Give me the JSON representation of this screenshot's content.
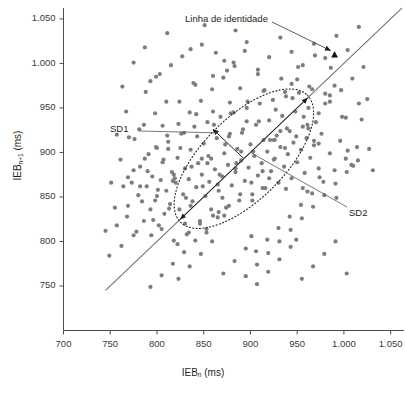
{
  "chart_data": {
    "type": "scatter",
    "title": "",
    "xlabel": "IEB_n (ms)",
    "ylabel": "IEB_n+1 (ms)",
    "xlabel_base": "IEB",
    "xlabel_sub": "n",
    "xlabel_unit": "(ms)",
    "ylabel_base": "IEB",
    "ylabel_sub": "n+1",
    "ylabel_unit": "(ms)",
    "xlim": [
      700,
      1060
    ],
    "ylim": [
      700,
      1060
    ],
    "xticks": [
      700,
      750,
      800,
      850,
      900,
      950,
      1000,
      1050
    ],
    "yticks": [
      750,
      800,
      850,
      900,
      950,
      1000,
      1050
    ],
    "xticklabels": [
      "700",
      "750",
      "800",
      "850",
      "900",
      "950",
      "1.000",
      "1.050"
    ],
    "yticklabels": [
      "750",
      "800",
      "850",
      "900",
      "950",
      "1.000",
      "1.050"
    ],
    "grid": false,
    "legend": "none",
    "point_color": "#7d7d7d",
    "point_radius": 2.1,
    "n_points": 300,
    "annotations": [
      {
        "name": "identity-line-label",
        "text": "Linha de identidade",
        "x": 990,
        "y": 1012
      },
      {
        "name": "sd1-label",
        "text": "SD1",
        "x": 845,
        "y": 917
      },
      {
        "name": "sd2-label",
        "text": "SD2",
        "x": 1010,
        "y": 855
      }
    ],
    "identity_line": {
      "x0": 745,
      "y0": 745,
      "x1": 1062,
      "y1": 1062,
      "color": "#6e6e6e"
    },
    "ellipse": {
      "cx": 893,
      "cy": 893,
      "sd2_semi": 96,
      "sd1_semi": 46,
      "angle_deg": 45,
      "style": "dotted",
      "color": "#1a1a1a"
    },
    "sd1_arrow": {
      "x0": 893,
      "y0": 893,
      "x1": 860,
      "y1": 926,
      "label": "SD1"
    },
    "sd2_arrows": [
      {
        "x0": 893,
        "y0": 893,
        "x1": 961,
        "y1": 961
      },
      {
        "x0": 893,
        "y0": 893,
        "x1": 825,
        "y1": 825
      }
    ],
    "identity_marker": {
      "x": 990,
      "y": 1010,
      "shape": "triangle",
      "color": "#111111"
    },
    "points": [
      [
        769,
        840
      ],
      [
        775,
        807
      ],
      [
        780,
        852
      ],
      [
        782,
        884
      ],
      [
        786,
        823
      ],
      [
        789,
        862
      ],
      [
        791,
        898
      ],
      [
        793,
        836
      ],
      [
        795,
        873
      ],
      [
        798,
        846
      ],
      [
        800,
        905
      ],
      [
        802,
        818
      ],
      [
        804,
        869
      ],
      [
        806,
        889
      ],
      [
        808,
        831
      ],
      [
        810,
        857
      ],
      [
        812,
        912
      ],
      [
        814,
        842
      ],
      [
        816,
        878
      ],
      [
        818,
        801
      ],
      [
        820,
        866
      ],
      [
        822,
        894
      ],
      [
        824,
        836
      ],
      [
        826,
        921
      ],
      [
        828,
        853
      ],
      [
        830,
        882
      ],
      [
        832,
        808
      ],
      [
        834,
        870
      ],
      [
        836,
        903
      ],
      [
        838,
        845
      ],
      [
        840,
        929
      ],
      [
        842,
        861
      ],
      [
        844,
        888
      ],
      [
        846,
        820
      ],
      [
        848,
        875
      ],
      [
        850,
        910
      ],
      [
        852,
        851
      ],
      [
        854,
        934
      ],
      [
        856,
        867
      ],
      [
        858,
        893
      ],
      [
        860,
        829
      ],
      [
        862,
        881
      ],
      [
        864,
        916
      ],
      [
        866,
        857
      ],
      [
        868,
        940
      ],
      [
        870,
        873
      ],
      [
        872,
        899
      ],
      [
        874,
        838
      ],
      [
        876,
        886
      ],
      [
        878,
        921
      ],
      [
        880,
        863
      ],
      [
        882,
        945
      ],
      [
        884,
        878
      ],
      [
        886,
        904
      ],
      [
        888,
        846
      ],
      [
        890,
        891
      ],
      [
        892,
        926
      ],
      [
        894,
        868
      ],
      [
        896,
        950
      ],
      [
        898,
        883
      ],
      [
        900,
        909
      ],
      [
        902,
        853
      ],
      [
        904,
        896
      ],
      [
        906,
        931
      ],
      [
        908,
        874
      ],
      [
        910,
        955
      ],
      [
        912,
        888
      ],
      [
        914,
        914
      ],
      [
        916,
        860
      ],
      [
        918,
        901
      ],
      [
        920,
        936
      ],
      [
        922,
        879
      ],
      [
        924,
        959
      ],
      [
        926,
        893
      ],
      [
        928,
        919
      ],
      [
        930,
        866
      ],
      [
        932,
        906
      ],
      [
        934,
        941
      ],
      [
        936,
        884
      ],
      [
        938,
        963
      ],
      [
        940,
        898
      ],
      [
        942,
        924
      ],
      [
        944,
        871
      ],
      [
        946,
        911
      ],
      [
        948,
        946
      ],
      [
        950,
        889
      ],
      [
        952,
        967
      ],
      [
        954,
        903
      ],
      [
        956,
        929
      ],
      [
        958,
        877
      ],
      [
        960,
        916
      ],
      [
        962,
        950
      ],
      [
        964,
        894
      ],
      [
        966,
        971
      ],
      [
        968,
        908
      ],
      [
        970,
        934
      ],
      [
        973,
        882
      ],
      [
        976,
        921
      ],
      [
        980,
        955
      ],
      [
        985,
        899
      ],
      [
        990,
        975
      ],
      [
        996,
        913
      ],
      [
        1002,
        939
      ],
      [
        1008,
        886
      ],
      [
        762,
        795
      ],
      [
        768,
        828
      ],
      [
        773,
        866
      ],
      [
        778,
        811
      ],
      [
        784,
        845
      ],
      [
        790,
        879
      ],
      [
        796,
        824
      ],
      [
        801,
        858
      ],
      [
        807,
        892
      ],
      [
        813,
        837
      ],
      [
        819,
        871
      ],
      [
        825,
        905
      ],
      [
        831,
        849
      ],
      [
        837,
        884
      ],
      [
        843,
        918
      ],
      [
        849,
        862
      ],
      [
        855,
        896
      ],
      [
        861,
        931
      ],
      [
        867,
        875
      ],
      [
        873,
        909
      ],
      [
        879,
        944
      ],
      [
        885,
        888
      ],
      [
        891,
        922
      ],
      [
        897,
        957
      ],
      [
        903,
        901
      ],
      [
        909,
        935
      ],
      [
        915,
        970
      ],
      [
        921,
        914
      ],
      [
        927,
        948
      ],
      [
        933,
        983
      ],
      [
        939,
        927
      ],
      [
        945,
        961
      ],
      [
        951,
        996
      ],
      [
        957,
        940
      ],
      [
        963,
        974
      ],
      [
        969,
        1009
      ],
      [
        786,
        931
      ],
      [
        798,
        944
      ],
      [
        810,
        957
      ],
      [
        822,
        797
      ],
      [
        834,
        810
      ],
      [
        846,
        823
      ],
      [
        858,
        836
      ],
      [
        870,
        849
      ],
      [
        882,
        1001
      ],
      [
        894,
        1014
      ],
      [
        906,
        789
      ],
      [
        918,
        802
      ],
      [
        930,
        815
      ],
      [
        942,
        828
      ],
      [
        954,
        841
      ],
      [
        966,
        854
      ],
      [
        978,
        867
      ],
      [
        990,
        880
      ],
      [
        1002,
        893
      ],
      [
        1014,
        906
      ],
      [
        775,
        880
      ],
      [
        787,
        893
      ],
      [
        799,
        906
      ],
      [
        811,
        919
      ],
      [
        823,
        932
      ],
      [
        835,
        945
      ],
      [
        847,
        958
      ],
      [
        859,
        971
      ],
      [
        871,
        984
      ],
      [
        883,
        997
      ],
      [
        895,
        761
      ],
      [
        907,
        774
      ],
      [
        919,
        787
      ],
      [
        931,
        800
      ],
      [
        943,
        813
      ],
      [
        955,
        826
      ],
      [
        967,
        839
      ],
      [
        979,
        852
      ],
      [
        991,
        865
      ],
      [
        1003,
        878
      ],
      [
        1015,
        891
      ],
      [
        1027,
        904
      ],
      [
        793,
        749
      ],
      [
        805,
        762
      ],
      [
        817,
        775
      ],
      [
        829,
        788
      ],
      [
        841,
        801
      ],
      [
        853,
        814
      ],
      [
        865,
        827
      ],
      [
        877,
        840
      ],
      [
        889,
        853
      ],
      [
        901,
        866
      ],
      [
        913,
        879
      ],
      [
        925,
        892
      ],
      [
        937,
        905
      ],
      [
        949,
        918
      ],
      [
        961,
        931
      ],
      [
        973,
        944
      ],
      [
        985,
        957
      ],
      [
        997,
        970
      ],
      [
        1009,
        983
      ],
      [
        1021,
        996
      ],
      [
        764,
        862
      ],
      [
        776,
        915
      ],
      [
        788,
        968
      ],
      [
        800,
        851
      ],
      [
        812,
        904
      ],
      [
        824,
        957
      ],
      [
        836,
        840
      ],
      [
        848,
        893
      ],
      [
        860,
        946
      ],
      [
        872,
        829
      ],
      [
        884,
        882
      ],
      [
        896,
        935
      ],
      [
        908,
        988
      ],
      [
        920,
        871
      ],
      [
        932,
        924
      ],
      [
        944,
        977
      ],
      [
        956,
        860
      ],
      [
        968,
        913
      ],
      [
        980,
        966
      ],
      [
        992,
        849
      ],
      [
        1004,
        902
      ],
      [
        1016,
        955
      ],
      [
        770,
        917
      ],
      [
        782,
        862
      ],
      [
        794,
        807
      ],
      [
        806,
        930
      ],
      [
        818,
        875
      ],
      [
        830,
        820
      ],
      [
        842,
        943
      ],
      [
        854,
        888
      ],
      [
        866,
        833
      ],
      [
        878,
        956
      ],
      [
        890,
        901
      ],
      [
        902,
        846
      ],
      [
        914,
        969
      ],
      [
        926,
        914
      ],
      [
        938,
        859
      ],
      [
        950,
        982
      ],
      [
        962,
        927
      ],
      [
        974,
        872
      ],
      [
        986,
        995
      ],
      [
        998,
        940
      ],
      [
        1010,
        885
      ],
      [
        757,
        818
      ],
      [
        769,
        872
      ],
      [
        781,
        926
      ],
      [
        793,
        980
      ],
      [
        805,
        814
      ],
      [
        817,
        868
      ],
      [
        829,
        922
      ],
      [
        841,
        976
      ],
      [
        853,
        810
      ],
      [
        865,
        864
      ],
      [
        877,
        918
      ],
      [
        889,
        972
      ],
      [
        901,
        806
      ],
      [
        913,
        860
      ],
      [
        925,
        914
      ],
      [
        937,
        968
      ],
      [
        949,
        802
      ],
      [
        961,
        856
      ],
      [
        973,
        910
      ],
      [
        985,
        964
      ],
      [
        1019,
        937
      ],
      [
        1025,
        960
      ],
      [
        1031,
        880
      ],
      [
        749,
        784
      ],
      [
        755,
        838
      ],
      [
        761,
        892
      ],
      [
        767,
        946
      ],
      [
        836,
        1016
      ],
      [
        848,
        1021
      ],
      [
        860,
        986
      ],
      [
        872,
        1003
      ],
      [
        884,
        1037
      ],
      [
        896,
        1024
      ],
      [
        908,
        993
      ],
      [
        920,
        1007
      ],
      [
        932,
        1029
      ],
      [
        944,
        1013
      ],
      [
        956,
        998
      ],
      [
        968,
        1022
      ],
      [
        980,
        1006
      ],
      [
        992,
        1031
      ],
      [
        1004,
        1015
      ],
      [
        1016,
        1041
      ],
      [
        745,
        812
      ],
      [
        751,
        866
      ],
      [
        757,
        920
      ],
      [
        763,
        974
      ],
      [
        775,
        1001
      ],
      [
        787,
        1018
      ],
      [
        799,
        985
      ],
      [
        811,
        1034
      ],
      [
        823,
        758
      ],
      [
        835,
        772
      ],
      [
        847,
        786
      ],
      [
        859,
        800
      ],
      [
        871,
        764
      ],
      [
        883,
        778
      ],
      [
        895,
        792
      ],
      [
        907,
        752
      ],
      [
        919,
        766
      ],
      [
        931,
        780
      ],
      [
        943,
        794
      ],
      [
        955,
        758
      ],
      [
        967,
        772
      ],
      [
        979,
        786
      ],
      [
        991,
        800
      ],
      [
        1003,
        764
      ],
      [
        803,
        988
      ],
      [
        815,
        998
      ],
      [
        827,
        1008
      ],
      [
        839,
        978
      ],
      [
        851,
        1043
      ],
      [
        863,
        1012
      ],
      [
        875,
        992
      ]
    ]
  },
  "caption": {
    "text": ""
  }
}
